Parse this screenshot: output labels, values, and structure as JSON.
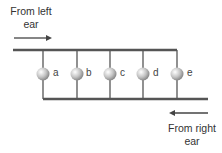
{
  "diagram": {
    "labels": {
      "left_ear_line1": "From left",
      "left_ear_line2": "ear",
      "right_ear_line1": "From right",
      "right_ear_line2": "ear"
    },
    "nodes": [
      "a",
      "b",
      "c",
      "d",
      "e"
    ],
    "colors": {
      "line": "#555555",
      "node_fill": "#c8c8c8"
    }
  }
}
